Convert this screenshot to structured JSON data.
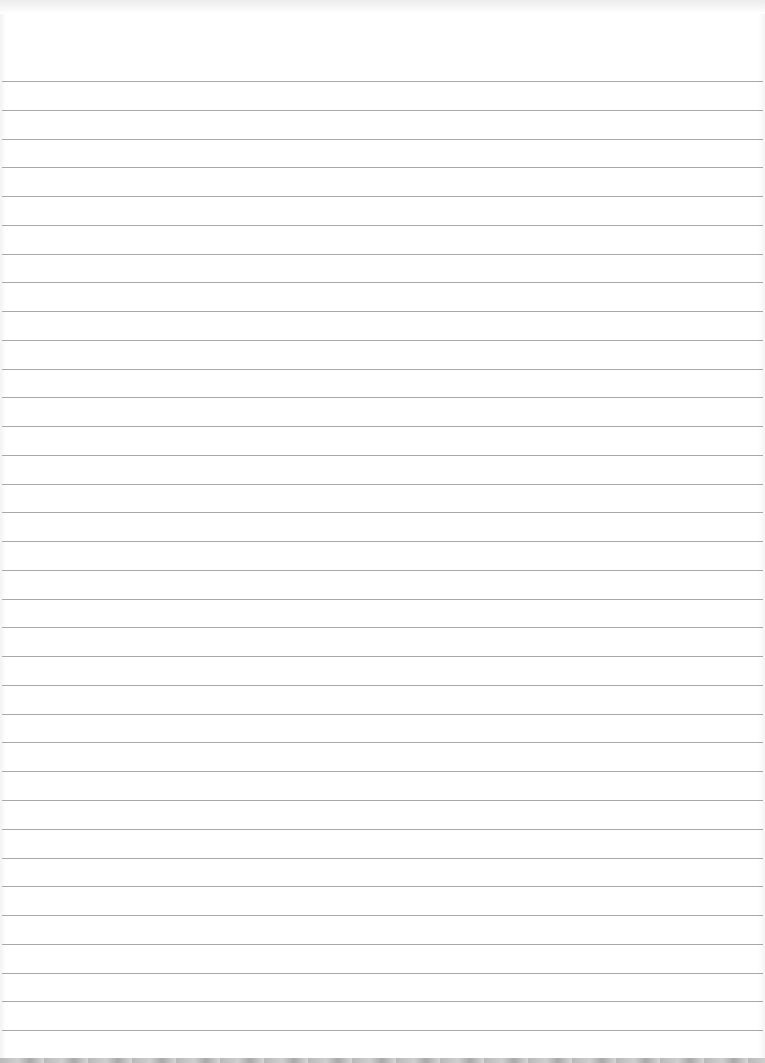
{
  "page": {
    "type": "lined-paper-sheet",
    "background_color": "#ffffff",
    "rule_color": "#9a9a9a",
    "rule_count": 34,
    "first_rule_y": 81,
    "rule_spacing_px": 28.76
  }
}
